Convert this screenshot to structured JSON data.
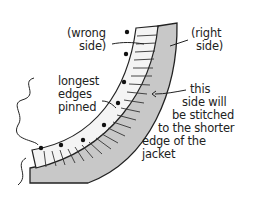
{
  "illustration": {
    "colors": {
      "background": "#ffffff",
      "ink": "#222222",
      "band_fill": "#c8c8c8",
      "gathered_fabric": "#f4f4f4"
    },
    "labels": {
      "wrong_side": [
        "(wrong",
        "side)"
      ],
      "right_side": [
        "(right",
        "side)"
      ],
      "longest_edges": [
        "longest",
        "edges",
        "pinned"
      ],
      "stitch_note": [
        "this",
        "side will",
        "be stitched",
        "to the shorter",
        "edge of the",
        "jacket"
      ]
    }
  }
}
